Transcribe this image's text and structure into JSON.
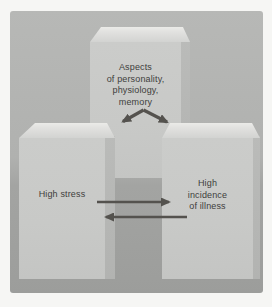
{
  "diagram": {
    "top_block": {
      "lines": [
        "Aspects",
        "of personality,",
        "physiology,",
        "memory"
      ]
    },
    "left_block": {
      "label": "High stress"
    },
    "right_block": {
      "lines": [
        "High",
        "incidence",
        "of illness"
      ]
    },
    "arrows": [
      {
        "name": "chevron-double-arrow",
        "direction": "down-left-and-down-right"
      },
      {
        "name": "stress-to-illness-arrow",
        "direction": "right"
      },
      {
        "name": "illness-to-stress-arrow",
        "direction": "left"
      }
    ]
  },
  "colors": {
    "page_bg": "#f6f6f4",
    "panel_bg_top": "#b7b8b6",
    "panel_bg_bottom": "#9c9d9b",
    "block_front": "#c8c9c7",
    "block_top": "#e2e2e0",
    "block_side": "#b2b3b1",
    "arrow_color": "#54524e",
    "text_color": "#3e3e3c"
  }
}
